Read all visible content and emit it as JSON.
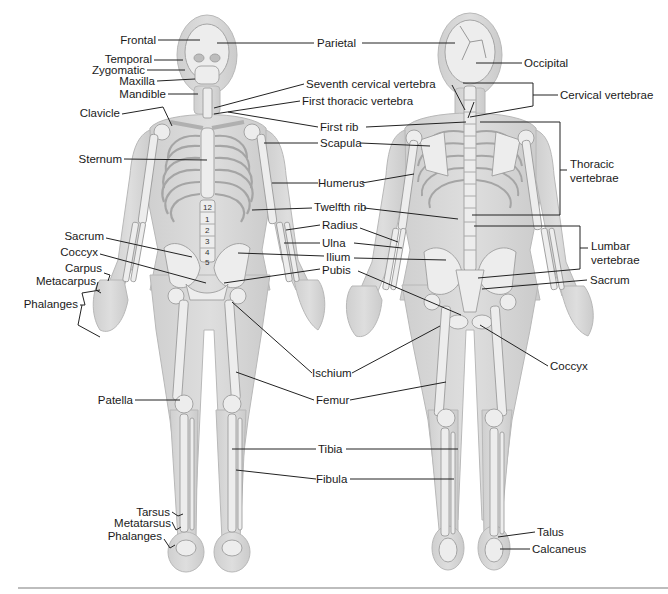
{
  "figure": {
    "colors": {
      "background": "#ffffff",
      "body": "#d4d4d4",
      "body_outline": "#b5b5b5",
      "bone": "#ececec",
      "bone_outline": "#9a9a9a",
      "leader": "#222222",
      "text": "#1a1a1a",
      "divider": "#bdbdbd"
    }
  },
  "anterior_view": {
    "labels": {
      "frontal": "Frontal",
      "temporal": "Temporal",
      "zygomatic": "Zygomatic",
      "maxilla": "Maxilla",
      "mandible": "Mandible",
      "clavicle": "Clavicle",
      "sternum": "Sternum",
      "sacrum": "Sacrum",
      "coccyx": "Coccyx",
      "carpus": "Carpus",
      "metacarpus": "Metacarpus",
      "phalanges_hand": "Phalanges",
      "patella": "Patella",
      "tarsus": "Tarsus",
      "metatarsus": "Metatarsus",
      "phalanges_foot": "Phalanges"
    },
    "vertebra_numbers": [
      "12",
      "1",
      "2",
      "3",
      "4",
      "5"
    ]
  },
  "center_labels": {
    "parietal": "Parietal",
    "seventh_cervical": "Seventh cervical vertebra",
    "first_thoracic": "First thoracic vertebra",
    "first_rib": "First rib",
    "scapula": "Scapula",
    "humerus": "Humerus",
    "twelfth_rib": "Twelfth rib",
    "radius": "Radius",
    "ulna": "Ulna",
    "ilium": "Ilium",
    "pubis": "Pubis",
    "ischium": "Ischium",
    "femur": "Femur",
    "tibia": "Tibia",
    "fibula": "Fibula"
  },
  "posterior_view": {
    "labels": {
      "occipital": "Occipital",
      "cervical_vertebrae": "Cervical vertebrae",
      "thoracic_vertebrae_1": "Thoracic",
      "thoracic_vertebrae_2": "vertebrae",
      "lumbar_vertebrae_1": "Lumbar",
      "lumbar_vertebrae_2": "vertebrae",
      "sacrum": "Sacrum",
      "coccyx": "Coccyx",
      "talus": "Talus",
      "calcaneus": "Calcaneus"
    }
  }
}
